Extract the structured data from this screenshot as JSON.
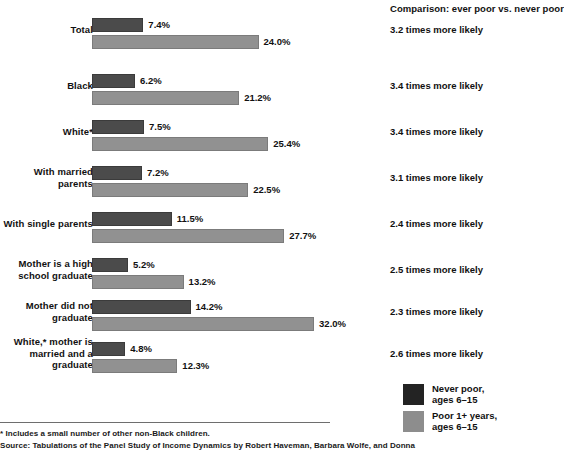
{
  "chart_data": {
    "type": "bar",
    "title": "",
    "orientation": "horizontal",
    "grouped": true,
    "xlabel": "",
    "ylabel": "",
    "xlim": [
      0,
      32
    ],
    "grid": false,
    "legend_position": "bottom-right",
    "value_suffix": "%",
    "categories": [
      "Total",
      "Black",
      "White*",
      "With married parents",
      "With single parents",
      "Mother is a high school graduate",
      "Mother did not graduate",
      "White,* mother is married and a graduate"
    ],
    "series": [
      {
        "name": "Never poor, ages 6–15",
        "color": "#4b4b4b",
        "values": [
          7.4,
          6.2,
          7.5,
          7.2,
          11.5,
          5.2,
          14.2,
          4.8
        ]
      },
      {
        "name": "Poor 1+ years, ages 6–15",
        "color": "#919191",
        "values": [
          24.0,
          21.2,
          25.4,
          22.5,
          27.7,
          13.2,
          32.0,
          12.3
        ]
      }
    ],
    "annotations": [
      "3.2 times more likely",
      "3.4 times more likely",
      "3.4 times more likely",
      "3.1 times more likely",
      "2.4 times more likely",
      "2.5 times more likely",
      "2.3 times more likely",
      "2.6 times more likely"
    ]
  },
  "groups": [
    {
      "label_lines": [
        "Total"
      ],
      "dark_value": 7.4,
      "dark_value_label": "7.4%",
      "light_value": 24.0,
      "light_value_label": "24.0%",
      "comparison": "3.2 times more likely"
    },
    {
      "label_lines": [
        "Black"
      ],
      "dark_value": 6.2,
      "dark_value_label": "6.2%",
      "light_value": 21.2,
      "light_value_label": "21.2%",
      "comparison": "3.4 times more likely"
    },
    {
      "label_lines": [
        "White*"
      ],
      "dark_value": 7.5,
      "dark_value_label": "7.5%",
      "light_value": 25.4,
      "light_value_label": "25.4%",
      "comparison": "3.4 times more likely"
    },
    {
      "label_lines": [
        "With married",
        "parents"
      ],
      "dark_value": 7.2,
      "dark_value_label": "7.2%",
      "light_value": 22.5,
      "light_value_label": "22.5%",
      "comparison": "3.1 times more likely"
    },
    {
      "label_lines": [
        "With single parents"
      ],
      "dark_value": 11.5,
      "dark_value_label": "11.5%",
      "light_value": 27.7,
      "light_value_label": "27.7%",
      "comparison": "2.4 times more likely"
    },
    {
      "label_lines": [
        "Mother is a high",
        "school graduate"
      ],
      "dark_value": 5.2,
      "dark_value_label": "5.2%",
      "light_value": 13.2,
      "light_value_label": "13.2%",
      "comparison": "2.5 times more likely"
    },
    {
      "label_lines": [
        "Mother did not",
        "graduate"
      ],
      "dark_value": 14.2,
      "dark_value_label": "14.2%",
      "light_value": 32.0,
      "light_value_label": "32.0%",
      "comparison": "2.3 times more likely"
    },
    {
      "label_lines": [
        "White,* mother is",
        "married and a",
        "graduate"
      ],
      "dark_value": 4.8,
      "dark_value_label": "4.8%",
      "light_value": 12.3,
      "light_value_label": "12.3%",
      "comparison": "2.6 times more likely"
    }
  ],
  "comparison": {
    "heading": "Comparison: ever poor vs. never poor"
  },
  "legend": {
    "items": [
      {
        "swatch": "dark",
        "line1": "Never poor,",
        "line2": "ages 6–15"
      },
      {
        "swatch": "light",
        "line1": "Poor 1+ years,",
        "line2": "ages 6–15"
      }
    ]
  },
  "footer": {
    "footnote": "* Includes a small number of other non-Black children.",
    "source": "Source: Tabulations of the Panel Study of Income Dynamics by Robert Haveman, Barbara Wolfe, and Donna"
  },
  "colors": {
    "dark_bar": "#4b4b4b",
    "light_bar": "#919191",
    "legend_dark": "#232323",
    "legend_light": "#8d8d8d",
    "text": "#111111",
    "rule": "#6e6e6e",
    "background": "#ffffff"
  },
  "scale": {
    "px_per_percent": 6.94,
    "bar_origin_x": 92
  }
}
